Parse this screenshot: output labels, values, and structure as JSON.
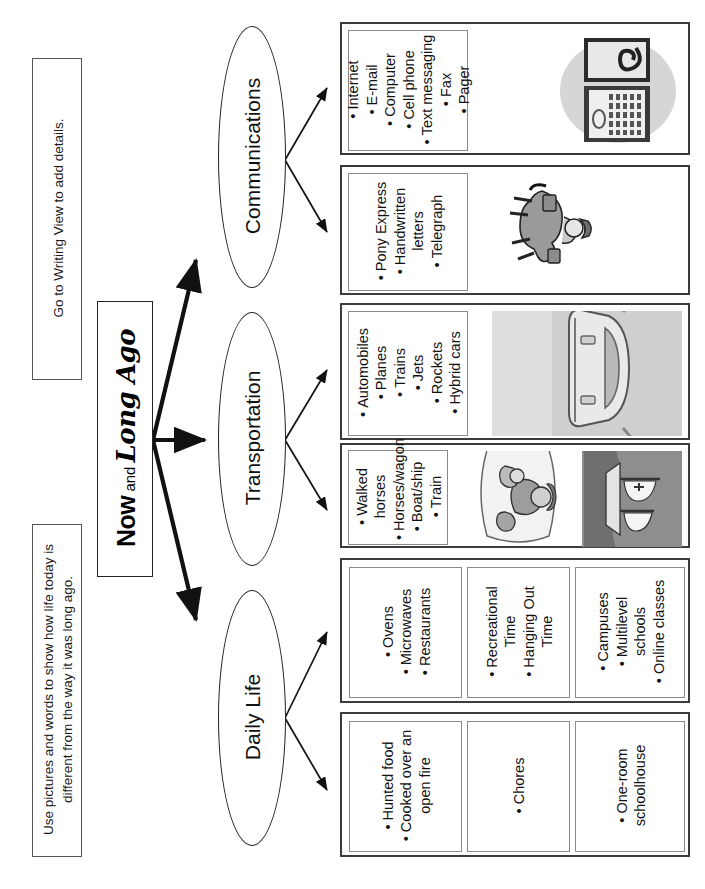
{
  "page": {
    "title": "Now and Long Ago",
    "title_parts": {
      "now": "Now",
      "and": " and ",
      "long_ago": "Long Ago"
    }
  },
  "instructions": {
    "left_note": "Go to Writing View to add details.",
    "right_note": "Use pictures and words to show how life today is different from the way it was long ago."
  },
  "branches": [
    {
      "label": "Communications"
    },
    {
      "label": "Transportation"
    },
    {
      "label": "Daily Life"
    }
  ],
  "panels": {
    "communications_now": {
      "items": [
        "Internet",
        "E-mail",
        "Computer",
        "Cell phone",
        "Text messaging",
        "Fax",
        "Pager"
      ],
      "art": "laptop-computer-clipart"
    },
    "communications_then": {
      "items": [
        "Pony Express",
        "Handwritten letters",
        "Telegraph"
      ],
      "art": "pony-express-rider-clipart"
    },
    "transportation_now": {
      "items": [
        "Automobiles",
        "Planes",
        "Trains",
        "Jets",
        "Rockets",
        "Hybrid cars"
      ],
      "art": "car-clipart"
    },
    "transportation_then": {
      "items": [
        "Walked horses",
        "Horses/wagon",
        "Boat/ship",
        "Train"
      ],
      "art_a": "pioneer-family-clipart",
      "art_b": "sailing-ship-clipart"
    },
    "daily_life_now": {
      "groups": [
        {
          "items": [
            "Ovens",
            "Microwaves",
            "Restaurants"
          ]
        },
        {
          "items": [
            "Recreational Time",
            "Hanging Out Time"
          ]
        },
        {
          "items": [
            "Campuses",
            "Multilevel schools",
            "Online classes"
          ]
        }
      ]
    },
    "daily_life_then": {
      "groups": [
        {
          "items": [
            "Hunted food",
            "Cooked over an open fire"
          ]
        },
        {
          "items": [
            "Chores"
          ]
        },
        {
          "items": [
            "One-room schoolhouse"
          ]
        }
      ]
    }
  },
  "colors": {
    "ink": "#111111",
    "box_border": "#555555",
    "thick_border": "#3b3b3b",
    "page_bg": "#ffffff"
  }
}
